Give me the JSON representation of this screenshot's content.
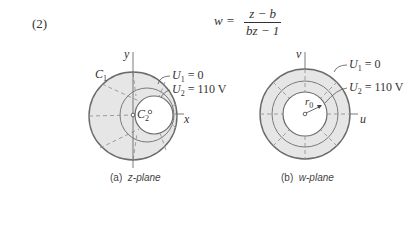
{
  "equation": {
    "number": "(2)",
    "lhs": "w =",
    "numerator": "z − b",
    "denominator": "bz − 1"
  },
  "panels": [
    {
      "id": "z-plane",
      "caption_tag": "(a)",
      "caption_text": "z-plane",
      "axis_x": "x",
      "axis_y": "y",
      "labels": {
        "c1": "C",
        "c1_sub": "1",
        "c2": "C",
        "c2_sub": "2",
        "u1": "U",
        "u1_sub": "1",
        "u1_val": "= 0",
        "u2": "U",
        "u2_sub": "2",
        "u2_val": "= 110 V"
      }
    },
    {
      "id": "w-plane",
      "caption_tag": "(b)",
      "caption_text": "w-plane",
      "axis_x": "u",
      "axis_y": "v",
      "labels": {
        "r0": "r",
        "r0_sub": "0",
        "u1": "U",
        "u1_sub": "1",
        "u1_val": "= 0",
        "u2": "U",
        "u2_sub": "2",
        "u2_val": "= 110 V"
      }
    }
  ],
  "colors": {
    "fill": "#e6e6e6",
    "stroke": "#6b6b6b",
    "dash": "#8a8a8a"
  }
}
